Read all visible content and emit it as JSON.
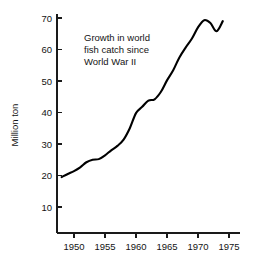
{
  "chart_data": {
    "type": "line",
    "title": "",
    "annotation": {
      "lines": [
        "Growth in world",
        "fish catch since",
        "World War II"
      ],
      "x": 1952.5,
      "y": 66.0
    },
    "xlabel": "",
    "ylabel": "Million ton",
    "xlim": [
      1946.5,
      1976.5
    ],
    "ylim": [
      0,
      73
    ],
    "grid": false,
    "legend": false,
    "xticks": [
      1950,
      1955,
      1960,
      1965,
      1970,
      1975
    ],
    "xtick_labels": [
      "1950",
      "1955",
      "1960",
      "1965",
      "1970",
      "1975"
    ],
    "yticks": [
      10,
      20,
      30,
      40,
      50,
      60,
      70
    ],
    "ytick_labels": [
      "10",
      "20",
      "30",
      "40",
      "50",
      "60",
      "70"
    ],
    "series": [
      {
        "name": "World fish catch",
        "color": "#000000",
        "x": [
          1948,
          1949,
          1950,
          1951,
          1952,
          1953,
          1954,
          1955,
          1956,
          1957,
          1958,
          1959,
          1960,
          1961,
          1962,
          1963,
          1964,
          1965,
          1966,
          1967,
          1968,
          1969,
          1970,
          1971,
          1972,
          1973,
          1974
        ],
        "values": [
          19.5,
          20.5,
          21.4,
          22.6,
          24.2,
          25.0,
          25.2,
          26.4,
          28.0,
          29.4,
          31.4,
          35.0,
          39.8,
          41.8,
          43.8,
          44.2,
          46.5,
          50.2,
          53.4,
          57.5,
          60.6,
          63.4,
          67.0,
          69.3,
          68.4,
          65.8,
          69.0
        ]
      }
    ]
  }
}
